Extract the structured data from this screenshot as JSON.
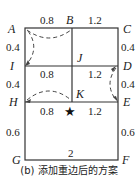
{
  "diagram": {
    "caption": "(b) 添加重边后的方案",
    "nodes": {
      "A": {
        "label": "A",
        "x": 25,
        "y": 28
      },
      "B": {
        "label": "B",
        "x": 72,
        "y": 28
      },
      "C": {
        "label": "C",
        "x": 118,
        "y": 28
      },
      "I": {
        "label": "I",
        "x": 25,
        "y": 66
      },
      "J": {
        "label": "J",
        "x": 72,
        "y": 66
      },
      "D": {
        "label": "D",
        "x": 118,
        "y": 66
      },
      "H": {
        "label": "H",
        "x": 25,
        "y": 102
      },
      "K": {
        "label": "K",
        "x": 72,
        "y": 102
      },
      "E": {
        "label": "E",
        "x": 118,
        "y": 102
      },
      "G": {
        "label": "G",
        "x": 25,
        "y": 160
      },
      "F": {
        "label": "F",
        "x": 118,
        "y": 160
      }
    },
    "edge_labels": {
      "AB": "0.8",
      "BC": "1.2",
      "AI": "0.4",
      "CD": "0.4",
      "IJ": "0.8",
      "JD": "1.2",
      "IH": "0.4",
      "DE": "0.4",
      "HK": "0.8",
      "KE": "1.2",
      "HG": "0.6",
      "EF": "0.6",
      "GF": "2"
    },
    "duplicate_edges": [
      "A-B",
      "A-I",
      "D-E",
      "H-K"
    ],
    "start_marker": {
      "symbol": "★",
      "near": "K"
    }
  }
}
